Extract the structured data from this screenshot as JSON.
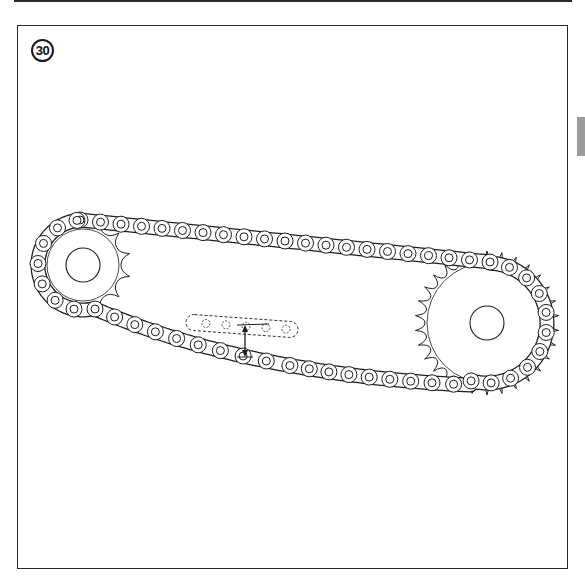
{
  "figure": {
    "number_label": "30",
    "caption_hidden": ""
  },
  "colors": {
    "ink": "#1e1e1e",
    "tab": "#9b9b9b",
    "background": "#ffffff"
  },
  "drawing": {
    "front_sprocket": {
      "cx": 83,
      "cy": 265,
      "body_r": 38,
      "hub_r": 17,
      "chain_r": 45,
      "teeth": 13
    },
    "rear_sprocket": {
      "cx": 487,
      "cy": 323,
      "body_r": 62,
      "hub_r": 17,
      "chain_r": 60,
      "teeth": 30
    },
    "chain_pitch": 19.5,
    "top_run": {
      "x1": 80,
      "y1": 220,
      "x2": 490,
      "y2": 262
    },
    "bottom_run": {
      "x1": 95,
      "y1": 309,
      "cx": 250,
      "cy": 375,
      "x2": 470,
      "y2": 385
    },
    "slack_indicator": {
      "dashed_chain": {
        "x1": 186,
        "y1": 322,
        "x2": 298,
        "y2": 330
      },
      "arrow": {
        "x": 245,
        "y_top": 325,
        "y_bottom": 357
      }
    }
  }
}
